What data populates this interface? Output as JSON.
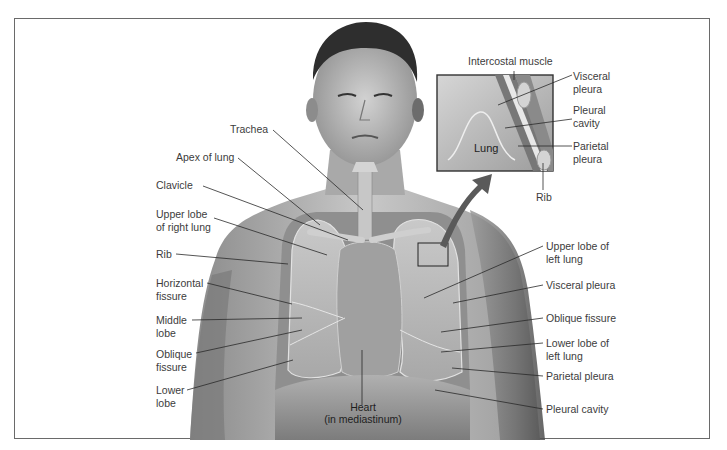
{
  "figure": {
    "type": "anatomical-illustration",
    "palette": {
      "background": "#ffffff",
      "frame": "#6a6a6a",
      "skin_light": "#cfcfcf",
      "skin_dark": "#5e5e5e",
      "lung": "#b9b9b9",
      "leader_line": "#2a2a2a",
      "label_text": "#3c3c3c"
    }
  },
  "labels_left": {
    "trachea": "Trachea",
    "apex": "Apex of lung",
    "clavicle": "Clavicle",
    "upper_lobe_right_1": "Upper lobe",
    "upper_lobe_right_2": "of right lung",
    "rib": "Rib",
    "horizontal_fissure_1": "Horizontal",
    "horizontal_fissure_2": "fissure",
    "middle_lobe_1": "Middle",
    "middle_lobe_2": "lobe",
    "oblique_fissure_1": "Oblique",
    "oblique_fissure_2": "fissure",
    "lower_lobe_1": "Lower",
    "lower_lobe_2": "lobe"
  },
  "labels_center": {
    "heart_1": "Heart",
    "heart_2": "(in mediastinum)"
  },
  "labels_right": {
    "upper_lobe_left_1": "Upper lobe of",
    "upper_lobe_left_2": "left lung",
    "visceral_pleura": "Visceral pleura",
    "oblique_fissure": "Oblique fissure",
    "lower_lobe_left_1": "Lower lobe of",
    "lower_lobe_left_2": "left lung",
    "parietal_pleura": "Parietal pleura",
    "pleural_cavity": "Pleural cavity"
  },
  "inset": {
    "intercostal_muscle": "Intercostal muscle",
    "visceral_pleura_1": "Visceral",
    "visceral_pleura_2": "pleura",
    "pleural_cavity_1": "Pleural",
    "pleural_cavity_2": "cavity",
    "parietal_pleura_1": "Parietal",
    "parietal_pleura_2": "pleura",
    "lung": "Lung",
    "rib": "Rib"
  }
}
